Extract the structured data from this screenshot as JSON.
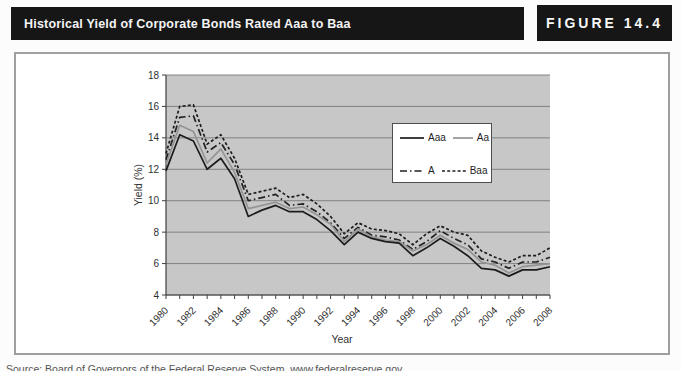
{
  "header": {
    "title": "Historical Yield of Corporate Bonds Rated Aaa to Baa",
    "figure_label": "FIGURE 14.4"
  },
  "caption": "Source: Board of Governors of the Federal Reserve System, www.federalreserve.gov.",
  "chart_data": {
    "type": "line",
    "title": "",
    "xlabel": "Year",
    "ylabel": "Yield (%)",
    "ylim": [
      4,
      18
    ],
    "yticks": [
      4,
      6,
      8,
      10,
      12,
      14,
      16,
      18
    ],
    "grid": "horizontal",
    "plot_bg": "#c7c7c7",
    "gridline_color": "#7a7a7a",
    "axis_color": "#3f3f3f",
    "legend_position": "middle-right",
    "x": [
      1980,
      1981,
      1982,
      1983,
      1984,
      1985,
      1986,
      1987,
      1988,
      1989,
      1990,
      1991,
      1992,
      1993,
      1994,
      1995,
      1996,
      1997,
      1998,
      1999,
      2000,
      2001,
      2002,
      2003,
      2004,
      2005,
      2006,
      2007,
      2008
    ],
    "xtick_label_step": 2,
    "series": [
      {
        "name": "Aaa",
        "color": "#1c1c1c",
        "dash": "",
        "values": [
          11.9,
          14.2,
          13.8,
          12.0,
          12.7,
          11.4,
          9.0,
          9.4,
          9.7,
          9.3,
          9.3,
          8.8,
          8.1,
          7.2,
          8.0,
          7.6,
          7.4,
          7.3,
          6.5,
          7.0,
          7.6,
          7.1,
          6.5,
          5.7,
          5.6,
          5.2,
          5.6,
          5.6,
          5.8
        ]
      },
      {
        "name": "Aa",
        "color": "#949494",
        "dash": "",
        "values": [
          12.3,
          14.8,
          14.4,
          12.4,
          13.3,
          11.8,
          9.5,
          9.7,
          9.9,
          9.5,
          9.6,
          9.1,
          8.5,
          7.4,
          8.2,
          7.7,
          7.5,
          7.4,
          6.8,
          7.2,
          7.8,
          7.3,
          6.9,
          6.1,
          5.9,
          5.4,
          5.8,
          5.9,
          6.0
        ]
      },
      {
        "name": "A",
        "color": "#222222",
        "dash": "7 3 1.5 3",
        "values": [
          12.6,
          15.3,
          15.4,
          13.1,
          13.7,
          12.3,
          10.0,
          10.2,
          10.4,
          9.7,
          9.8,
          9.3,
          8.6,
          7.6,
          8.3,
          7.8,
          7.7,
          7.5,
          6.9,
          7.4,
          8.1,
          7.6,
          7.2,
          6.3,
          6.1,
          5.7,
          6.1,
          6.1,
          6.4
        ]
      },
      {
        "name": "Baa",
        "color": "#1c1c1c",
        "dash": "3 2.2",
        "values": [
          13.0,
          16.0,
          16.1,
          13.6,
          14.2,
          12.7,
          10.4,
          10.6,
          10.8,
          10.2,
          10.4,
          9.8,
          9.0,
          7.9,
          8.6,
          8.2,
          8.1,
          7.9,
          7.2,
          7.9,
          8.4,
          8.0,
          7.8,
          6.8,
          6.4,
          6.1,
          6.5,
          6.5,
          7.0
        ]
      }
    ]
  }
}
